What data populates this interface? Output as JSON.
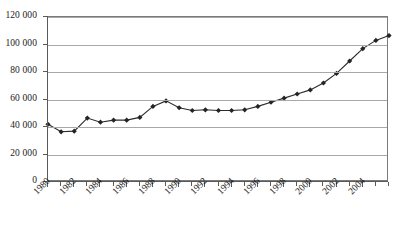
{
  "chart_data": {
    "type": "line",
    "title": "",
    "xlabel": "",
    "ylabel": "",
    "grid": true,
    "legend": false,
    "ylim": [
      0,
      120000
    ],
    "xlim": [
      1980,
      2006
    ],
    "ytick_labels": [
      "120 000",
      "100 000",
      "80 000",
      "60 000",
      "40 000",
      "20 000",
      "0"
    ],
    "ytick_values": [
      120000,
      100000,
      80000,
      60000,
      40000,
      20000,
      0
    ],
    "xtick_labels": [
      "1980",
      "1982",
      "1984",
      "1986",
      "1988",
      "1990",
      "1992",
      "1994",
      "1996",
      "1998",
      "2000",
      "2002",
      "2004"
    ],
    "xtick_values": [
      1980,
      1982,
      1984,
      1986,
      1988,
      1990,
      1992,
      1994,
      1996,
      1998,
      2000,
      2002,
      2004
    ],
    "x": [
      1980,
      1981,
      1982,
      1983,
      1984,
      1985,
      1986,
      1987,
      1988,
      1989,
      1990,
      1991,
      1992,
      1993,
      1994,
      1995,
      1996,
      1997,
      1998,
      1999,
      2000,
      2001,
      2002,
      2003,
      2004,
      2005,
      2006
    ],
    "values": [
      42000,
      36500,
      37000,
      46500,
      43500,
      45000,
      45000,
      47000,
      55000,
      59000,
      54000,
      52000,
      52500,
      52000,
      52000,
      52500,
      55000,
      58000,
      61000,
      64000,
      67000,
      72000,
      79000,
      88000,
      97000,
      103000,
      106500
    ],
    "series": [
      {
        "name": "series-1",
        "values": [
          42000,
          36500,
          37000,
          46500,
          43500,
          45000,
          45000,
          47000,
          55000,
          59000,
          54000,
          52000,
          52500,
          52000,
          52000,
          52500,
          55000,
          58000,
          61000,
          64000,
          67000,
          72000,
          79000,
          88000,
          97000,
          103000,
          106500
        ]
      }
    ],
    "marker": "diamond",
    "line_color": "#2b2b2b",
    "marker_color": "#242424",
    "gridline_color": "#a8a8a8",
    "axis_color": "#5a5a5a"
  }
}
